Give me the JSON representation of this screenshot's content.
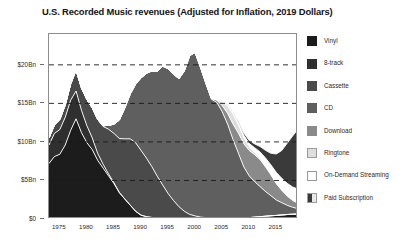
{
  "chart_data": {
    "type": "area",
    "stacked": true,
    "title": "U.S. Recorded Music revenues (Adjusted for Inflation, 2019 Dollars)",
    "xlabel": "",
    "ylabel": "",
    "xlim": [
      1973,
      2019
    ],
    "ylim": [
      0,
      24
    ],
    "grid": true,
    "grid_style": "dashed-horizontal",
    "legend_position": "right",
    "y_ticks": [
      {
        "value": 0,
        "label": "$0"
      },
      {
        "value": 5,
        "label": "$5Bn"
      },
      {
        "value": 10,
        "label": "$10Bn"
      },
      {
        "value": 15,
        "label": "$15Bn"
      },
      {
        "value": 20,
        "label": "$20Bn"
      }
    ],
    "x_ticks": [
      {
        "value": 1975,
        "label": "1975"
      },
      {
        "value": 1980,
        "label": "1980"
      },
      {
        "value": 1985,
        "label": "1985"
      },
      {
        "value": 1990,
        "label": "1990"
      },
      {
        "value": 1995,
        "label": "1995"
      },
      {
        "value": 2000,
        "label": "2000"
      },
      {
        "value": 2005,
        "label": "2005"
      },
      {
        "value": 2010,
        "label": "2010"
      },
      {
        "value": 2015,
        "label": "2015"
      }
    ],
    "x": [
      1973,
      1974,
      1975,
      1976,
      1977,
      1978,
      1979,
      1980,
      1981,
      1982,
      1983,
      1984,
      1985,
      1986,
      1987,
      1988,
      1989,
      1990,
      1991,
      1992,
      1993,
      1994,
      1995,
      1996,
      1997,
      1998,
      1999,
      2000,
      2001,
      2002,
      2003,
      2004,
      2005,
      2006,
      2007,
      2008,
      2009,
      2010,
      2011,
      2012,
      2013,
      2014,
      2015,
      2016,
      2017,
      2018,
      2019
    ],
    "series": [
      {
        "name": "Vinyl",
        "color": "#1c1c1c",
        "values": [
          7.2,
          8.1,
          8.4,
          9.6,
          11.5,
          13.0,
          11.2,
          9.9,
          9.0,
          7.6,
          6.6,
          5.6,
          4.6,
          3.4,
          2.6,
          1.8,
          1.0,
          0.5,
          0.3,
          0.2,
          0.15,
          0.12,
          0.1,
          0.1,
          0.1,
          0.1,
          0.1,
          0.1,
          0.1,
          0.1,
          0.1,
          0.1,
          0.1,
          0.1,
          0.1,
          0.12,
          0.15,
          0.18,
          0.24,
          0.3,
          0.36,
          0.42,
          0.46,
          0.52,
          0.58,
          0.62,
          0.64
        ]
      },
      {
        "name": "8-track",
        "color": "#2f2f2f",
        "values": [
          2.4,
          3.0,
          3.2,
          3.6,
          3.9,
          3.6,
          2.9,
          2.2,
          1.5,
          0.9,
          0.5,
          0.25,
          0.1,
          0.04,
          0.0,
          0.0,
          0.0,
          0.0,
          0.0,
          0.0,
          0.0,
          0.0,
          0.0,
          0.0,
          0.0,
          0.0,
          0.0,
          0.0,
          0.0,
          0.0,
          0.0,
          0.0,
          0.0,
          0.0,
          0.0,
          0.0,
          0.0,
          0.0,
          0.0,
          0.0,
          0.0,
          0.0,
          0.0,
          0.0,
          0.0,
          0.0,
          0.0
        ]
      },
      {
        "name": "Cassette",
        "color": "#4a4a4a",
        "values": [
          0.9,
          1.1,
          1.3,
          1.6,
          2.1,
          2.7,
          2.9,
          3.4,
          3.9,
          4.4,
          4.9,
          5.8,
          6.4,
          7.0,
          7.8,
          8.6,
          8.9,
          8.4,
          7.6,
          6.6,
          5.4,
          4.3,
          3.2,
          2.3,
          1.5,
          0.9,
          0.5,
          0.3,
          0.15,
          0.08,
          0.04,
          0.02,
          0.01,
          0.0,
          0.0,
          0.0,
          0.0,
          0.0,
          0.0,
          0.0,
          0.0,
          0.0,
          0.0,
          0.0,
          0.0,
          0.0,
          0.0
        ]
      },
      {
        "name": "CD",
        "color": "#5f5f5f",
        "values": [
          0.0,
          0.0,
          0.0,
          0.0,
          0.0,
          0.0,
          0.0,
          0.0,
          0.0,
          0.0,
          0.1,
          0.5,
          1.2,
          2.4,
          4.0,
          5.8,
          7.6,
          9.4,
          11.0,
          12.4,
          13.6,
          15.4,
          16.2,
          16.4,
          16.6,
          18.2,
          20.6,
          21.2,
          19.4,
          17.4,
          15.4,
          15.0,
          13.8,
          12.2,
          10.2,
          8.4,
          6.6,
          5.4,
          4.6,
          3.9,
          3.2,
          2.6,
          2.0,
          1.6,
          1.2,
          0.9,
          0.7
        ]
      },
      {
        "name": "Download",
        "color": "#8a8a8a",
        "values": [
          0.0,
          0.0,
          0.0,
          0.0,
          0.0,
          0.0,
          0.0,
          0.0,
          0.0,
          0.0,
          0.0,
          0.0,
          0.0,
          0.0,
          0.0,
          0.0,
          0.0,
          0.0,
          0.0,
          0.0,
          0.0,
          0.0,
          0.0,
          0.0,
          0.0,
          0.0,
          0.0,
          0.0,
          0.0,
          0.0,
          0.1,
          0.3,
          0.8,
          1.4,
          2.0,
          2.6,
          3.0,
          3.3,
          3.5,
          3.5,
          3.2,
          2.7,
          2.1,
          1.6,
          1.2,
          0.9,
          0.7
        ]
      },
      {
        "name": "Ringtone",
        "color": "#dedede",
        "values": [
          0.0,
          0.0,
          0.0,
          0.0,
          0.0,
          0.0,
          0.0,
          0.0,
          0.0,
          0.0,
          0.0,
          0.0,
          0.0,
          0.0,
          0.0,
          0.0,
          0.0,
          0.0,
          0.0,
          0.0,
          0.0,
          0.0,
          0.0,
          0.0,
          0.0,
          0.0,
          0.0,
          0.0,
          0.0,
          0.0,
          0.0,
          0.1,
          0.5,
          1.0,
          1.3,
          1.1,
          0.8,
          0.5,
          0.3,
          0.2,
          0.15,
          0.1,
          0.08,
          0.06,
          0.05,
          0.04,
          0.03
        ]
      },
      {
        "name": "On-Demand Streaming",
        "color": "#ffffff",
        "values": [
          0.0,
          0.0,
          0.0,
          0.0,
          0.0,
          0.0,
          0.0,
          0.0,
          0.0,
          0.0,
          0.0,
          0.0,
          0.0,
          0.0,
          0.0,
          0.0,
          0.0,
          0.0,
          0.0,
          0.0,
          0.0,
          0.0,
          0.0,
          0.0,
          0.0,
          0.0,
          0.0,
          0.0,
          0.0,
          0.0,
          0.0,
          0.0,
          0.0,
          0.05,
          0.1,
          0.2,
          0.3,
          0.4,
          0.6,
          0.8,
          1.0,
          1.2,
          1.4,
          1.5,
          1.6,
          1.7,
          1.8
        ]
      },
      {
        "name": "Paid Subscription",
        "color": "#3a3a3a",
        "values": [
          0.0,
          0.0,
          0.0,
          0.0,
          0.0,
          0.0,
          0.0,
          0.0,
          0.0,
          0.0,
          0.0,
          0.0,
          0.0,
          0.0,
          0.0,
          0.0,
          0.0,
          0.0,
          0.0,
          0.0,
          0.0,
          0.0,
          0.0,
          0.0,
          0.0,
          0.0,
          0.0,
          0.0,
          0.0,
          0.0,
          0.0,
          0.0,
          0.05,
          0.1,
          0.15,
          0.2,
          0.3,
          0.4,
          0.5,
          0.7,
          1.0,
          1.5,
          2.4,
          3.6,
          5.2,
          6.6,
          7.8
        ]
      }
    ]
  },
  "legend": {
    "items": [
      {
        "label": "Vinyl",
        "swatch": "#1c1c1c",
        "style": "solid"
      },
      {
        "label": "8-track",
        "swatch": "#2f2f2f",
        "style": "solid"
      },
      {
        "label": "Cassette",
        "swatch": "#4a4a4a",
        "style": "solid"
      },
      {
        "label": "CD",
        "swatch": "#5f5f5f",
        "style": "solid"
      },
      {
        "label": "Download",
        "swatch": "#8a8a8a",
        "style": "solid"
      },
      {
        "label": "Ringtone",
        "swatch": "#dedede",
        "style": "bordered"
      },
      {
        "label": "On-Demand Streaming",
        "swatch": "#ffffff",
        "style": "bordered"
      },
      {
        "label": "Paid Subscription",
        "swatch": "#3a3a3a",
        "style": "gradient"
      }
    ]
  },
  "colors": {
    "frame": "#8d8d8d",
    "gridline": "#1a1a1a",
    "separator": "#ffffff",
    "text": "#2b2b2b"
  }
}
